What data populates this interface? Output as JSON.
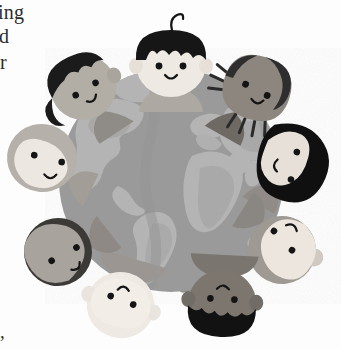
{
  "page": {
    "width": 341,
    "height": 349,
    "background_color": "#fdfdfd",
    "media": "scanned book page, grayscale halftone illustration"
  },
  "page_text_fragments": [
    {
      "id": "frag-top-1",
      "text": "ing",
      "position": "top-left margin, clipped"
    },
    {
      "id": "frag-top-2",
      "text": "d",
      "position": "top-left margin, clipped"
    },
    {
      "id": "frag-top-3",
      "text": "r",
      "position": "top-left margin, clipped"
    },
    {
      "id": "frag-bottom-1",
      "text": ",",
      "position": "bottom-left margin, clipped"
    }
  ],
  "illustration": {
    "title": "Children of the world holding hands around the globe",
    "description": "Eight cartoon children with varied skin tones and hairstyles join hands in a ring encircling a gray globe showing the continents.",
    "style": "flat cartoon clip-art, grayscale halftone scan",
    "colors": {
      "globe_ocean": "#9a9a9a",
      "globe_land": "#b4b4b4",
      "globe_land_shadow": "#8d8d8d",
      "skin_light": "#efe9e3",
      "skin_pale": "#e4ded6",
      "skin_medium": "#b9b5ae",
      "skin_tan": "#a9a39b",
      "skin_dark": "#8a857e",
      "skin_deep": "#6f6a64",
      "hair_black": "#1b1b1b",
      "hair_dark": "#3a3a3a",
      "hair_blonde": "#e8e4dc",
      "hair_light_gray": "#cfcac2",
      "outline": "#777373",
      "sleeve_gray": "#8f8b86",
      "feature_dark": "#141414"
    },
    "globe": {
      "center_x": 171,
      "center_y": 180,
      "radius": 112,
      "continents_visible": [
        "North America",
        "South America",
        "Greenland",
        "Europe",
        "Africa",
        "Asia"
      ]
    },
    "children": [
      {
        "id": "child-top",
        "position": "top",
        "angle_deg": 270,
        "hair": "black bowl cut with cowlick curl",
        "hair_color": "#161616",
        "skin_tone": "light",
        "skin_color": "#efe9e3",
        "expression": "smiling",
        "orientation_deg": 0
      },
      {
        "id": "child-top-left",
        "position": "top-left",
        "angle_deg": 225,
        "hair": "short black hair",
        "hair_color": "#1b1b1b",
        "skin_tone": "medium",
        "skin_color": "#b2ada5",
        "expression": "smiling",
        "orientation_deg": -45
      },
      {
        "id": "child-top-right",
        "position": "top-right",
        "angle_deg": 315,
        "hair": "dark hair with beaded braids",
        "hair_color": "#2e2e2e",
        "skin_tone": "deep",
        "skin_color": "#8c867f",
        "expression": "smiling",
        "orientation_deg": 45
      },
      {
        "id": "child-right",
        "position": "right",
        "angle_deg": 0,
        "hair": "long straight black bob",
        "hair_color": "#101010",
        "skin_tone": "pale",
        "skin_color": "#e6e0d8",
        "expression": "smiling",
        "orientation_deg": 90
      },
      {
        "id": "child-bottom-right",
        "position": "bottom-right",
        "angle_deg": 45,
        "hair": "light blonde hair with top bun",
        "hair_color": "#e2ddd4",
        "skin_tone": "pale",
        "skin_color": "#ece6de",
        "expression": "smiling",
        "orientation_deg": 135
      },
      {
        "id": "child-bottom",
        "position": "bottom",
        "angle_deg": 90,
        "hair": "short black hair",
        "hair_color": "#121212",
        "skin_tone": "deep",
        "skin_color": "#7c766f",
        "expression": "smiling",
        "orientation_deg": 180
      },
      {
        "id": "child-bottom-left",
        "position": "bottom-left",
        "angle_deg": 135,
        "hair": "very light blonde hair",
        "hair_color": "#eeeae3",
        "skin_tone": "pale",
        "skin_color": "#f0ebe4",
        "expression": "smiling",
        "orientation_deg": 200
      },
      {
        "id": "child-left-lower",
        "position": "left-lower",
        "angle_deg": 160,
        "hair": "dark brown hair",
        "hair_color": "#3c3a37",
        "skin_tone": "medium",
        "skin_color": "#a8a39c",
        "expression": "smiling",
        "orientation_deg": 240
      },
      {
        "id": "child-left",
        "position": "left",
        "angle_deg": 180,
        "hair": "light hair / head covering",
        "hair_color": "#d8d3cb",
        "skin_tone": "light",
        "skin_color": "#ebe5de",
        "expression": "smiling",
        "orientation_deg": 270
      }
    ]
  }
}
